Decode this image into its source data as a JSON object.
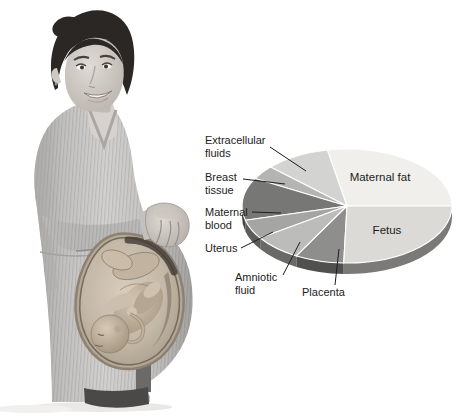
{
  "chart_data": {
    "type": "pie",
    "style_3d": true,
    "title": "",
    "legend_position": "outside-left-with-leader-lines",
    "values_are_percent_estimates": true,
    "geometry": {
      "cx": 347,
      "cy": 206,
      "rx": 105,
      "ry": 57,
      "depth": 11,
      "start_angle": 0,
      "direction": "ccw"
    },
    "text_color": "#1c1c1c",
    "leader_color": "#1c1c1c",
    "separator_color": "#ffffff",
    "slices": [
      {
        "label": "Maternal fat",
        "value": 28,
        "color": "#f0efeb",
        "label_inside": {
          "x": 380,
          "y": 181
        }
      },
      {
        "label": "Extracellular fluids",
        "value": 10,
        "color": "#d3d3d1",
        "label_outside": {
          "lines": [
            "Extracellular",
            "fluids"
          ],
          "x": 205,
          "y": 144
        },
        "leader": [
          270,
          147,
          306,
          171
        ]
      },
      {
        "label": "Breast tissue",
        "value": 4,
        "color": "#b4b4b2",
        "label_outside": {
          "lines": [
            "Breast",
            "tissue"
          ],
          "x": 205,
          "y": 181
        },
        "leader": [
          243,
          179,
          285,
          184
        ]
      },
      {
        "label": "Maternal blood",
        "value": 12,
        "color": "#777775",
        "label_outside": {
          "lines": [
            "Maternal",
            "blood"
          ],
          "x": 205,
          "y": 216
        },
        "leader": [
          252,
          212,
          281,
          213
        ]
      },
      {
        "label": "Uterus",
        "value": 5.5,
        "color": "#a5a5a3",
        "label_outside": {
          "lines": [
            "Uterus"
          ],
          "x": 205,
          "y": 252
        },
        "leader": [
          241,
          248,
          273,
          232
        ]
      },
      {
        "label": "Amniotic fluid",
        "value": 7.5,
        "color": "#bcbcba",
        "label_outside": {
          "lines": [
            "Amniotic",
            "fluid"
          ],
          "x": 235,
          "y": 281
        },
        "leader": [
          283,
          275,
          300,
          242
        ]
      },
      {
        "label": "Placenta",
        "value": 7.5,
        "color": "#8e8e8c",
        "label_outside": {
          "lines": [
            "Placenta"
          ],
          "x": 302,
          "y": 296
        },
        "leader": [
          335,
          285,
          339,
          249
        ]
      },
      {
        "label": "Fetus",
        "value": 25.5,
        "color": "#dbdad6",
        "label_inside": {
          "x": 387,
          "y": 234
        }
      }
    ]
  }
}
